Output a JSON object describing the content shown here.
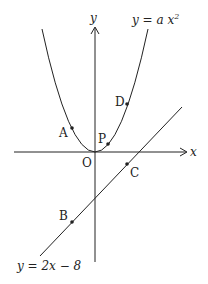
{
  "axes": {
    "x_label": "x",
    "y_label": "y",
    "origin_label": "O"
  },
  "curves": {
    "parabola": {
      "label_prefix": "y = a x",
      "label_exp": "2"
    },
    "line": {
      "label": "y = 2x − 8"
    }
  },
  "points": {
    "A": "A",
    "B": "B",
    "C": "C",
    "D": "D",
    "P": "P"
  },
  "colors": {
    "stroke": "#222222",
    "background": "#ffffff"
  }
}
